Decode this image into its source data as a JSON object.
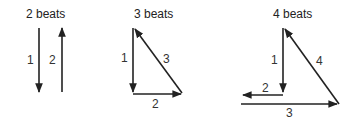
{
  "diagrams": [
    {
      "title": "2 beats",
      "strokes": [
        {
          "label": "1",
          "direction": "down"
        },
        {
          "label": "2",
          "direction": "up"
        }
      ]
    },
    {
      "title": "3 beats",
      "strokes": [
        {
          "label": "1",
          "direction": "down"
        },
        {
          "label": "2",
          "direction": "right"
        },
        {
          "label": "3",
          "direction": "up-left diagonal"
        }
      ]
    },
    {
      "title": "4 beats",
      "strokes": [
        {
          "label": "1",
          "direction": "down"
        },
        {
          "label": "2",
          "direction": "left"
        },
        {
          "label": "3",
          "direction": "right"
        },
        {
          "label": "4",
          "direction": "up-left diagonal"
        }
      ]
    }
  ],
  "colors": {
    "stroke": "#222222",
    "text": "#222222",
    "background": "#ffffff"
  }
}
